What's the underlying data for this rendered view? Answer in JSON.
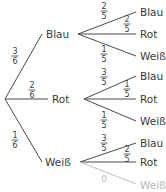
{
  "diagram": {
    "type": "probability-tree",
    "level1": [
      {
        "label": "Blau",
        "prob": {
          "num": "3",
          "den": "6"
        }
      },
      {
        "label": "Rot",
        "prob": {
          "num": "2",
          "den": "6"
        }
      },
      {
        "label": "Weiß",
        "prob": {
          "num": "1",
          "den": "6"
        }
      }
    ],
    "level2": [
      {
        "parent": "Blau",
        "children": [
          {
            "label": "Blau",
            "prob": {
              "num": "2",
              "den": "5"
            }
          },
          {
            "label": "Rot",
            "prob": {
              "num": "2",
              "den": "5"
            }
          },
          {
            "label": "Weiß",
            "prob": {
              "num": "1",
              "den": "5"
            }
          }
        ]
      },
      {
        "parent": "Rot",
        "children": [
          {
            "label": "Blau",
            "prob": {
              "num": "3",
              "den": "5"
            }
          },
          {
            "label": "Rot",
            "prob": {
              "num": "1",
              "den": "5"
            }
          },
          {
            "label": "Weiß",
            "prob": {
              "num": "1",
              "den": "5"
            }
          }
        ]
      },
      {
        "parent": "Weiß",
        "children": [
          {
            "label": "Blau",
            "prob": {
              "num": "3",
              "den": "5"
            }
          },
          {
            "label": "Rot",
            "prob": {
              "num": "2",
              "den": "5"
            }
          },
          {
            "label": "Weiß",
            "prob": {
              "num": "0",
              "den": ""
            }
          }
        ]
      }
    ]
  }
}
